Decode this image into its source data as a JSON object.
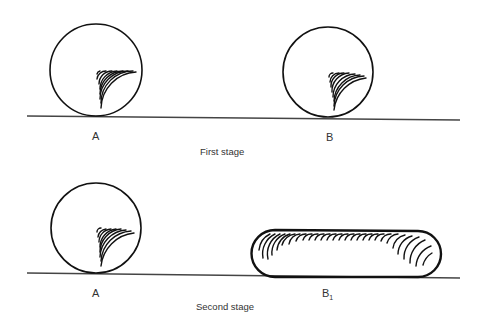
{
  "diagram": {
    "stroke_color": "#111111",
    "ground_color": "#444444",
    "stages": [
      {
        "caption": "First stage",
        "objects": [
          {
            "label": "A",
            "shape": "sphere"
          },
          {
            "label": "B",
            "shape": "sphere"
          }
        ]
      },
      {
        "caption": "Second stage",
        "objects": [
          {
            "label": "A",
            "shape": "sphere"
          },
          {
            "label": "B",
            "label_subscript": "1",
            "shape": "flattened-capsule"
          }
        ]
      }
    ]
  }
}
